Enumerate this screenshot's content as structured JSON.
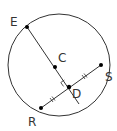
{
  "diagram": {
    "type": "circle-geometry",
    "colors": {
      "stroke": "#333333",
      "point": "#000000",
      "background": "#ffffff"
    },
    "circle": {
      "cx": 59,
      "cy": 65,
      "r": 51
    },
    "points": {
      "E": {
        "label": "E",
        "x": 27,
        "y": 27
      },
      "C": {
        "label": "C",
        "x": 55,
        "y": 67
      },
      "D": {
        "label": "D",
        "x": 69,
        "y": 87
      },
      "S": {
        "label": "S",
        "x": 101,
        "y": 65
      },
      "R": {
        "label": "R",
        "x": 41,
        "y": 108
      }
    },
    "segments": [
      {
        "name": "diameter-ED",
        "from": "E",
        "to": "end",
        "end": {
          "x": 79,
          "y": 104
        }
      },
      {
        "name": "chord-RS",
        "from": "R",
        "to": "S"
      }
    ],
    "marks": {
      "right_angle_at": "D",
      "congruent_ticks": [
        "RD",
        "DS"
      ]
    },
    "labels": {
      "E": "E",
      "C": "C",
      "D": "D",
      "S": "S",
      "R": "R"
    }
  }
}
